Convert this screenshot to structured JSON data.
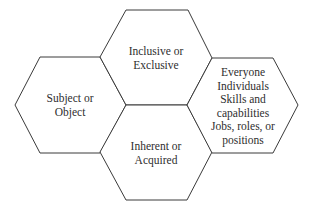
{
  "diagram": {
    "type": "hexagon-cluster",
    "colors": {
      "stroke": "#3a3a3a",
      "fill": "#ffffff",
      "text": "#2e2e2e"
    },
    "hexagons": [
      {
        "id": "left",
        "lines": [
          "Subject or",
          "Object"
        ]
      },
      {
        "id": "top",
        "lines": [
          "Inclusive or",
          "Exclusive"
        ]
      },
      {
        "id": "bottom",
        "lines": [
          "Inherent or",
          "Acquired"
        ]
      },
      {
        "id": "right",
        "lines": [
          "Everyone",
          "Individuals",
          "Skills and",
          "capabilities",
          "Jobs, roles, or",
          "positions"
        ]
      }
    ]
  }
}
